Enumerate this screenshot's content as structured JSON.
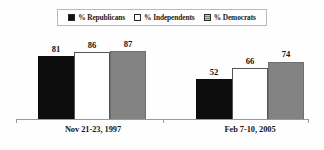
{
  "chart_data": {
    "type": "bar",
    "title": "",
    "subtitle": "",
    "xlabel": "",
    "ylabel": "",
    "ylim": [
      0,
      100
    ],
    "grid": false,
    "legend_position": "top-center",
    "categories": [
      "Nov 21-23, 1997",
      "Feb 7-10, 2005"
    ],
    "series": [
      {
        "name": "% Republicans",
        "color": "#0d0d0d",
        "swatch": "black",
        "values": [
          81,
          52
        ]
      },
      {
        "name": "% Independents",
        "color": "#ffffff",
        "swatch": "white",
        "values": [
          86,
          66
        ]
      },
      {
        "name": "% Democrats",
        "color": "#838383",
        "swatch": "gray",
        "values": [
          87,
          74
        ]
      }
    ],
    "groups": [
      {
        "label": "Nov 21-23, 1997",
        "bars": [
          {
            "series": "% Republicans",
            "value": 81,
            "label": "81"
          },
          {
            "series": "% Independents",
            "value": 86,
            "label": "86"
          },
          {
            "series": "% Democrats",
            "value": 87,
            "label": "87"
          }
        ]
      },
      {
        "label": "Feb 7-10, 2005",
        "bars": [
          {
            "series": "% Republicans",
            "value": 52,
            "label": "52"
          },
          {
            "series": "% Independents",
            "value": 66,
            "label": "66"
          },
          {
            "series": "% Democrats",
            "value": 74,
            "label": "74"
          }
        ]
      }
    ]
  },
  "legend": {
    "items": [
      {
        "label": "% Republicans",
        "swatch_name": "legend-swatch-republicans"
      },
      {
        "label": "% Independents",
        "swatch_name": "legend-swatch-independents"
      },
      {
        "label": "% Democrats",
        "swatch_name": "legend-swatch-democrats"
      }
    ]
  },
  "colors": {
    "republicans": "#0d0d0d",
    "independents": "#ffffff",
    "democrats": "#838383",
    "axis": "#9a9a9a",
    "text": "#131313",
    "legend_border": "#b9b9b9",
    "background": "#fefefe"
  }
}
